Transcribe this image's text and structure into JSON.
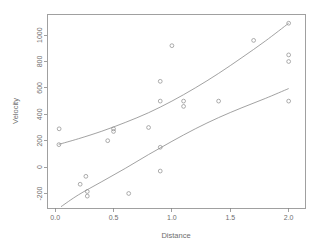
{
  "chart_data": {
    "type": "scatter",
    "title": "",
    "xlabel": "Distance",
    "ylabel": "Velocity",
    "xlim": [
      -0.07,
      2.14
    ],
    "ylim": [
      -310,
      1160
    ],
    "xticks": [
      0.0,
      0.5,
      1.0,
      1.5,
      2.0
    ],
    "xticklabels": [
      "0.0",
      "0.5",
      "1.0",
      "1.5",
      "2.0"
    ],
    "yticks": [
      -200,
      0,
      200,
      400,
      600,
      800,
      1000
    ],
    "yticklabels": [
      "-200",
      "0",
      "200",
      "400",
      "600",
      "800",
      "1000"
    ],
    "grid": false,
    "legend": null,
    "point_marker": "open-circle",
    "points": [
      {
        "x": 0.032,
        "y": 170
      },
      {
        "x": 0.034,
        "y": 290
      },
      {
        "x": 0.214,
        "y": -130
      },
      {
        "x": 0.263,
        "y": -70
      },
      {
        "x": 0.275,
        "y": -185
      },
      {
        "x": 0.275,
        "y": -220
      },
      {
        "x": 0.45,
        "y": 200
      },
      {
        "x": 0.5,
        "y": 290
      },
      {
        "x": 0.5,
        "y": 270
      },
      {
        "x": 0.63,
        "y": -200
      },
      {
        "x": 0.8,
        "y": 300
      },
      {
        "x": 0.9,
        "y": 650
      },
      {
        "x": 0.9,
        "y": 500
      },
      {
        "x": 0.9,
        "y": 150
      },
      {
        "x": 0.9,
        "y": -30
      },
      {
        "x": 1.0,
        "y": 920
      },
      {
        "x": 1.1,
        "y": 500
      },
      {
        "x": 1.1,
        "y": 460
      },
      {
        "x": 1.4,
        "y": 500
      },
      {
        "x": 1.7,
        "y": 960
      },
      {
        "x": 2.0,
        "y": 1090
      },
      {
        "x": 2.0,
        "y": 850
      },
      {
        "x": 2.0,
        "y": 800
      },
      {
        "x": 2.0,
        "y": 500
      }
    ],
    "series": [
      {
        "name": "upper-band",
        "type": "curve",
        "points": [
          {
            "x": 0.03,
            "y": 172
          },
          {
            "x": 0.2,
            "y": 215
          },
          {
            "x": 0.4,
            "y": 272
          },
          {
            "x": 0.6,
            "y": 338
          },
          {
            "x": 0.8,
            "y": 412
          },
          {
            "x": 1.0,
            "y": 500
          },
          {
            "x": 1.2,
            "y": 600
          },
          {
            "x": 1.4,
            "y": 710
          },
          {
            "x": 1.6,
            "y": 830
          },
          {
            "x": 1.8,
            "y": 955
          },
          {
            "x": 2.0,
            "y": 1090
          }
        ]
      },
      {
        "name": "lower-band",
        "type": "curve",
        "points": [
          {
            "x": 0.05,
            "y": -300
          },
          {
            "x": 0.2,
            "y": -210
          },
          {
            "x": 0.4,
            "y": -110
          },
          {
            "x": 0.6,
            "y": -10
          },
          {
            "x": 0.8,
            "y": 95
          },
          {
            "x": 1.0,
            "y": 195
          },
          {
            "x": 1.2,
            "y": 290
          },
          {
            "x": 1.4,
            "y": 375
          },
          {
            "x": 1.6,
            "y": 450
          },
          {
            "x": 1.8,
            "y": 520
          },
          {
            "x": 2.0,
            "y": 595
          }
        ]
      }
    ]
  },
  "plot_geometry": {
    "left": 47,
    "right": 305,
    "top": 14,
    "bottom": 208
  },
  "axis_titles": {
    "x": "Distance",
    "y": "Velocity"
  }
}
